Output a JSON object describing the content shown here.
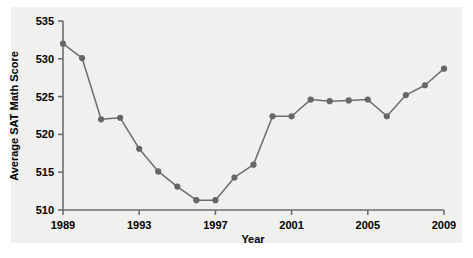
{
  "chart_data": {
    "type": "line",
    "title": "",
    "xlabel": "Year",
    "ylabel": "Average SAT Math Score",
    "x": [
      1989,
      1990,
      1991,
      1992,
      1993,
      1994,
      1995,
      1996,
      1997,
      1998,
      1999,
      2000,
      2001,
      2002,
      2003,
      2004,
      2005,
      2006,
      2007,
      2008,
      2009
    ],
    "values": [
      532.0,
      530.1,
      522.0,
      522.2,
      518.1,
      515.1,
      513.1,
      511.3,
      511.3,
      514.3,
      516.0,
      522.4,
      522.4,
      524.6,
      524.4,
      524.5,
      524.6,
      522.4,
      525.2,
      526.5,
      528.7
    ],
    "series": [
      {
        "name": "Average SAT Math Score",
        "values": [
          532.0,
          530.1,
          522.0,
          522.2,
          518.1,
          515.1,
          513.1,
          511.3,
          511.3,
          514.3,
          516.0,
          522.4,
          522.4,
          524.6,
          524.4,
          524.5,
          524.6,
          522.4,
          525.2,
          526.5,
          528.7
        ]
      }
    ],
    "xlim": [
      1989,
      2009
    ],
    "ylim": [
      510,
      535
    ],
    "xticks": [
      1989,
      1993,
      1997,
      2001,
      2005,
      2009
    ],
    "xtick_labels": [
      "1989",
      "1993",
      "1997",
      "2001",
      "2005",
      "2009"
    ],
    "yticks": [
      510,
      515,
      520,
      525,
      530,
      535
    ],
    "ytick_labels": [
      "510",
      "515",
      "520",
      "525",
      "530",
      "535"
    ],
    "grid": false,
    "legend": "none",
    "marker": "circle",
    "line_color": "#6e6e6e",
    "marker_color": "#666666",
    "plot_background": "#f0f0ef",
    "figure_background": "#ffffff"
  }
}
